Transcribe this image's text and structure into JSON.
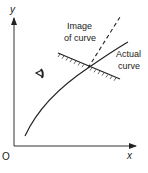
{
  "diagram": {
    "axes": {
      "y_label": "y",
      "x_label": "x",
      "origin_label": "O"
    },
    "labels": {
      "image_line1": "Image",
      "image_line2": "of curve",
      "actual_line1": "Actual",
      "actual_line2": "curve"
    },
    "icons": {
      "eye": "eye-icon"
    },
    "colors": {
      "ink": "#222222",
      "background": "#ffffff"
    }
  }
}
